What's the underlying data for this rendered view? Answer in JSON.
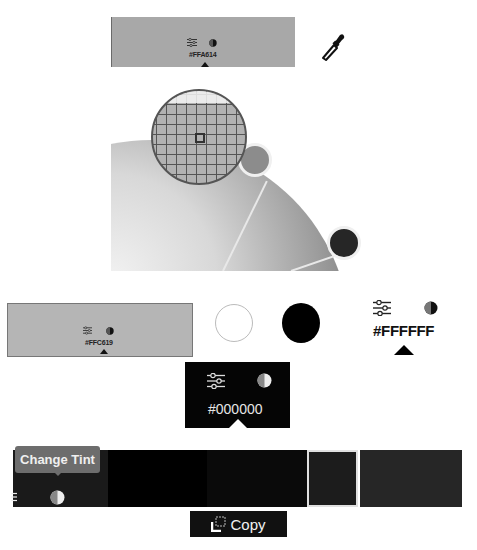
{
  "top_swatch": {
    "hex": "#FFA614",
    "fill": "#a8a8a8"
  },
  "lower_swatch": {
    "hex": "#FFC619",
    "fill": "#b5b5b5"
  },
  "contrast_options": {
    "white": "#FFFFFF",
    "black": "#000000"
  },
  "text_color_control": {
    "hex": "#FFFFFF"
  },
  "dark_popover": {
    "hex": "#000000"
  },
  "tint_strip": {
    "tooltip": "Change Tint",
    "segments": [
      {
        "color": "#000000",
        "width": 100
      },
      {
        "color": "#0a0a0a",
        "width": 100
      },
      {
        "color": "#1c1c1c",
        "width": 52,
        "selected": true
      },
      {
        "color": "#262626",
        "width": 102
      }
    ]
  },
  "copy_button": {
    "label": "Copy"
  },
  "icons": {
    "sliders": "sliders-icon",
    "contrast": "contrast-icon",
    "eyedropper": "eyedropper-icon",
    "copy": "copy-icon"
  }
}
